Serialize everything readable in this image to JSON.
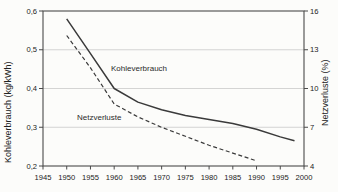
{
  "chart_data": {
    "type": "line",
    "title": "",
    "grid": "horizontal",
    "legend": "inline-labels",
    "colors": {
      "line": "#3a3a3a",
      "grid": "#c9c9c9",
      "axis": "#4a4a4a",
      "background": "#fcfcfa"
    },
    "x_axis": {
      "min": 1945,
      "max": 2000,
      "ticks": [
        1945,
        1950,
        1955,
        1960,
        1965,
        1970,
        1975,
        1980,
        1985,
        1990,
        1995,
        2000
      ]
    },
    "left_axis": {
      "label": "Kohleverbrauch (kg/kWh)",
      "min": 0.2,
      "max": 0.6,
      "ticks": [
        {
          "value": 0.6,
          "label": "0,6"
        },
        {
          "value": 0.5,
          "label": "0,5"
        },
        {
          "value": 0.4,
          "label": "0,4"
        },
        {
          "value": 0.3,
          "label": "0,3"
        },
        {
          "value": 0.2,
          "label": "0,2"
        }
      ]
    },
    "right_axis": {
      "label": "Netzverluste (%)",
      "min": 4,
      "max": 16,
      "ticks": [
        {
          "value": 16,
          "label": "16"
        },
        {
          "value": 13,
          "label": "13"
        },
        {
          "value": 10,
          "label": "10"
        },
        {
          "value": 7,
          "label": "7"
        },
        {
          "value": 4,
          "label": "4"
        }
      ]
    },
    "series": [
      {
        "name": "Kohleverbrauch",
        "axis": "left",
        "unit": "kg/kWh",
        "line_style": "solid",
        "color": "#3a3a3a",
        "points": [
          [
            1950,
            0.58
          ],
          [
            1955,
            0.49
          ],
          [
            1960,
            0.4
          ],
          [
            1965,
            0.365
          ],
          [
            1970,
            0.345
          ],
          [
            1975,
            0.33
          ],
          [
            1980,
            0.32
          ],
          [
            1985,
            0.31
          ],
          [
            1990,
            0.295
          ],
          [
            1995,
            0.275
          ],
          [
            1998,
            0.265
          ]
        ]
      },
      {
        "name": "Netzverluste",
        "axis": "right",
        "unit": "%",
        "line_style": "dashed",
        "color": "#3a3a3a",
        "points": [
          [
            1950,
            14.1
          ],
          [
            1955,
            11.6
          ],
          [
            1960,
            8.8
          ],
          [
            1965,
            7.8
          ],
          [
            1970,
            7.0
          ],
          [
            1975,
            6.3
          ],
          [
            1980,
            5.6
          ],
          [
            1985,
            5.0
          ],
          [
            1990,
            4.4
          ]
        ]
      }
    ],
    "annotations": [
      {
        "text": "Kohleverbrauch",
        "series": "Kohleverbrauch"
      },
      {
        "text": "Netzverluste",
        "series": "Netzverluste"
      }
    ]
  }
}
